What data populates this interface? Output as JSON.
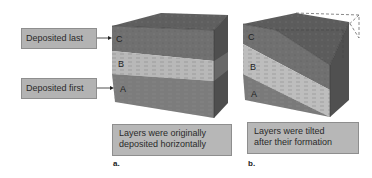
{
  "figure": {
    "panel_a": {
      "letter": "a.",
      "labels": {
        "top": "Deposited last",
        "bottom": "Deposited first"
      },
      "layers": [
        "C",
        "B",
        "A"
      ],
      "caption": {
        "line1": "Layers were originally",
        "line2": "deposited horizontally"
      }
    },
    "panel_b": {
      "letter": "b.",
      "layers": [
        "C",
        "B",
        "A"
      ],
      "caption": {
        "line1": "Layers were tilted",
        "line2": "after their formation"
      }
    }
  },
  "colors": {
    "layer_c": "#707070",
    "layer_b": "#b8b8b8",
    "layer_a": "#7c7c7c",
    "top_face": "#5f5f5f",
    "side_face": "#555555",
    "label_bg": "#b3b3b3"
  }
}
